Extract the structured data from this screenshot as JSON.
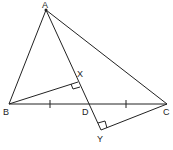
{
  "diagram": {
    "type": "geometry",
    "points": {
      "A": {
        "label": "A",
        "x": 46,
        "y": 10
      },
      "B": {
        "label": "B",
        "x": 9,
        "y": 104
      },
      "C": {
        "label": "C",
        "x": 167,
        "y": 104
      },
      "D": {
        "label": "D",
        "x": 89,
        "y": 104
      },
      "X": {
        "label": "X",
        "x": 78,
        "y": 82
      },
      "Y": {
        "label": "Y",
        "x": 101,
        "y": 130
      }
    },
    "segments": [
      "AB",
      "AC",
      "BC",
      "AY",
      "BX",
      "CY"
    ],
    "right_angles": [
      "X",
      "Y"
    ],
    "equal_marks": [
      "BD",
      "DC"
    ],
    "stroke_color": "#222222"
  }
}
